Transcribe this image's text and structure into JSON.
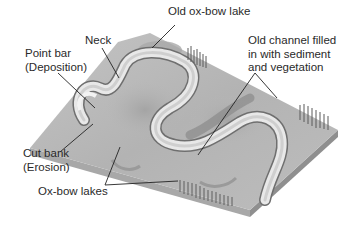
{
  "diagram": {
    "colors": {
      "surface": "#b9b9b9",
      "surface_dark": "#9c9c9c",
      "channel": "#e6e6e6",
      "channel_edge": "#6a6a6a",
      "side_left": "#a6a6a6",
      "side_right": "#8e8e8e",
      "vegetation": "#5a5a5a",
      "leader": "#222222",
      "text": "#2a2a2a"
    },
    "labels": {
      "old_oxbow_lake": "Old ox-bow lake",
      "neck": "Neck",
      "point_bar": [
        "Point bar",
        "(Deposition)"
      ],
      "old_channel": [
        "Old channel filled",
        "in with sediment",
        "and vegetation"
      ],
      "cut_bank": [
        "Cut bank",
        "(Erosion)"
      ],
      "oxbow_lakes": "Ox-bow lakes"
    }
  }
}
